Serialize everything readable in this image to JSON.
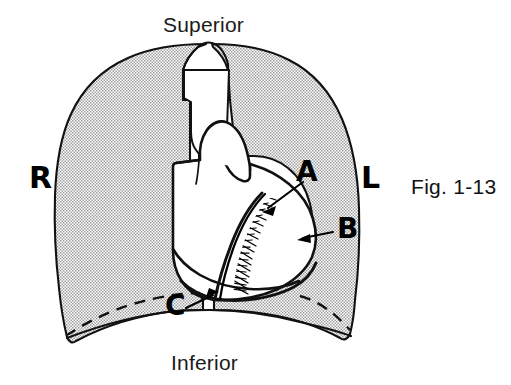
{
  "figure": {
    "caption": "Fig. 1-13",
    "background_color": "#ffffff",
    "ink_color": "#000000",
    "lung_fill_color": "#d9d9d9",
    "lung_stipple_color": "#8a8a8a",
    "heart_fill_color": "#ffffff",
    "hatch_color": "#000000"
  },
  "orientation": {
    "superior": "Superior",
    "inferior": "Inferior"
  },
  "sides": {
    "right": "R",
    "left": "L"
  },
  "callouts": [
    {
      "id": "a",
      "label": "A",
      "target": "heart-upper-left-border",
      "arrow_from": [
        303,
        182
      ],
      "arrow_to": [
        262,
        212
      ]
    },
    {
      "id": "b",
      "label": "B",
      "target": "cardiac-notch-hatched-margin",
      "arrow_from": [
        333,
        232
      ],
      "arrow_to": [
        298,
        240
      ]
    },
    {
      "id": "c",
      "label": "C",
      "target": "inferior-heart-border-diaphragm",
      "arrow_from": [
        186,
        308
      ],
      "arrow_to": [
        218,
        292
      ]
    }
  ],
  "structures": [
    {
      "name": "right-lung",
      "side": "right"
    },
    {
      "name": "left-lung",
      "side": "left"
    },
    {
      "name": "trachea-notch",
      "side": "midline"
    },
    {
      "name": "heart-silhouette",
      "side": "midline"
    },
    {
      "name": "diaphragm-dashed-line",
      "side": "right"
    },
    {
      "name": "hatched-cardiac-margin",
      "side": "left"
    }
  ]
}
